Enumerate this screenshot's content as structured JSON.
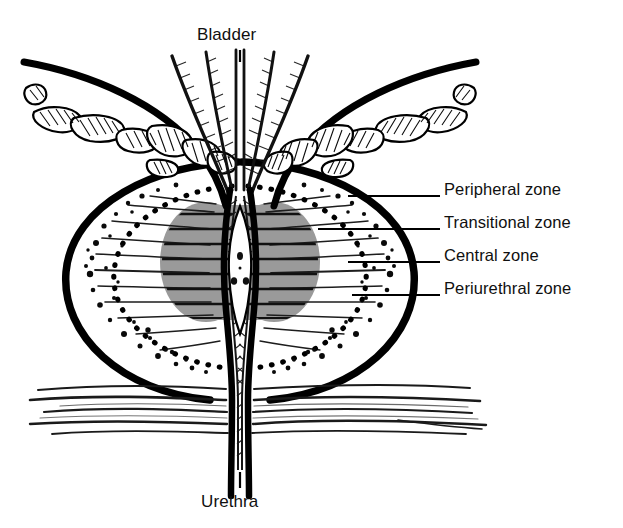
{
  "figure": {
    "truncated_caption_above": "different disorders.",
    "top_label": "Bladder",
    "bottom_label": "Urethra",
    "background_color": "#ffffff",
    "ink_color": "#000000",
    "transitional_zone_fill": "#9a9a9a",
    "peripheral_zone_fill": "#ffffff"
  },
  "zone_labels": [
    {
      "id": "peripheral",
      "text": "Peripheral zone"
    },
    {
      "id": "transitional",
      "text": "Transitional zone"
    },
    {
      "id": "central",
      "text": "Central zone"
    },
    {
      "id": "periurethral",
      "text": "Periurethral zone"
    }
  ],
  "structures": [
    {
      "id": "bladder",
      "name": "Bladder",
      "description": "Muscular wall with hatched detrusor bundles flaring to upper left and upper right"
    },
    {
      "id": "bladder-neck",
      "name": "Bladder neck",
      "description": "Central funnel of converging smooth-muscle fibres"
    },
    {
      "id": "prostate-capsule",
      "name": "Prostate capsule",
      "description": "Thick black rounded outline enclosing the gland"
    },
    {
      "id": "transitional-zone",
      "name": "Transitional zone",
      "description": "Grey shaded lobes flanking the proximal urethra"
    },
    {
      "id": "central-zone",
      "name": "Central zone",
      "description": "Dotted oval boundary with radiating glandular ducts"
    },
    {
      "id": "peripheral-zone",
      "name": "Peripheral zone",
      "description": "Stippled outer gland region beneath the capsule"
    },
    {
      "id": "periurethral-zone",
      "name": "Periurethral zone",
      "description": "Narrow hatched sleeve immediately around the urethra"
    },
    {
      "id": "urethra",
      "name": "Urethra",
      "description": "Vertical canal with spindle-shaped prostatic lumen and verumontanum"
    },
    {
      "id": "pelvic-floor",
      "name": "Pelvic floor tissue",
      "description": "Horizontal wavy fascial lines below the prostate apex"
    }
  ]
}
